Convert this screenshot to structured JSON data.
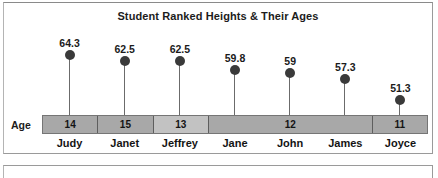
{
  "chart_data": {
    "type": "bar",
    "title": "Student Ranked Heights & Their Ages",
    "xlabel": "",
    "ylabel": "",
    "grid": false,
    "legend": "none",
    "row_header_label": "Age",
    "categories": [
      "Judy",
      "Janet",
      "Jeffrey",
      "Jane",
      "John",
      "James",
      "Joyce"
    ],
    "values": [
      64.3,
      62.5,
      62.5,
      59.8,
      59,
      57.3,
      51.3
    ],
    "value_labels": [
      "64.3",
      "62.5",
      "62.5",
      "59.8",
      "59",
      "57.3",
      "51.3"
    ],
    "ages": [
      14,
      15,
      13,
      12,
      12,
      12,
      11
    ],
    "age_bands": [
      {
        "label": "14",
        "span": 1,
        "shade": "dark"
      },
      {
        "label": "15",
        "span": 1,
        "shade": "dark"
      },
      {
        "label": "13",
        "span": 1,
        "shade": "light"
      },
      {
        "label": "12",
        "span": 3,
        "shade": "dark"
      },
      {
        "label": "11",
        "span": 1,
        "shade": "dark"
      }
    ],
    "series": [
      {
        "name": "Height",
        "values": [
          64.3,
          62.5,
          62.5,
          59.8,
          59,
          57.3,
          51.3
        ]
      }
    ],
    "ylim": [
      48,
      66
    ]
  },
  "colors": {
    "marker": "#3a3a3a",
    "stem": "#6b6b6b",
    "band_dark": "#a8a8a8",
    "band_light": "#c2c2c2",
    "band_border": "#5e5e5e",
    "panel_border": "#9a9a9a",
    "text": "#141414",
    "background": "#ffffff"
  }
}
